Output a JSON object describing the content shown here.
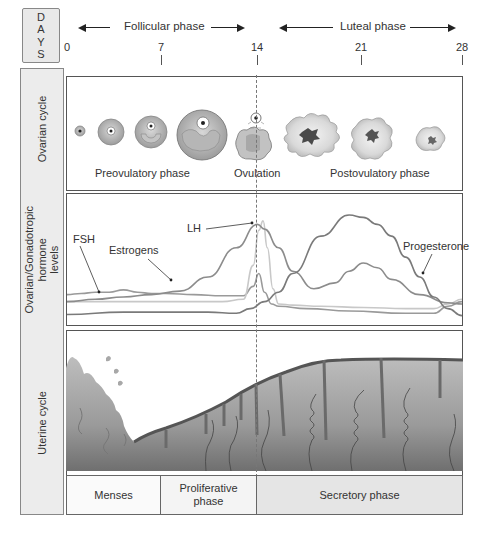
{
  "header": {
    "days_label": [
      "D",
      "A",
      "Y",
      "S"
    ],
    "follicular_phase": "Follicular phase",
    "luteal_phase": "Luteal phase",
    "day_ticks": [
      {
        "label": "0",
        "x": 67
      },
      {
        "label": "7",
        "x": 161
      },
      {
        "label": "14",
        "x": 257
      },
      {
        "label": "21",
        "x": 361
      },
      {
        "label": "28",
        "x": 463
      }
    ]
  },
  "rows": {
    "ovarian": {
      "label": "Ovarian cycle",
      "stage_labels": {
        "preovulatory": "Preovulatory phase",
        "ovulation": "Ovulation",
        "postovulatory": "Postovulatory phase"
      }
    },
    "hormone": {
      "label_lines": [
        "Ovarian/Gonadotropic",
        "hormone",
        "levels"
      ],
      "curve_labels": {
        "fsh": "FSH",
        "estrogens": "Estrogens",
        "lh": "LH",
        "progesterone": "Progesterone"
      }
    },
    "uterine": {
      "label": "Uterine cycle",
      "phases": [
        {
          "label": "Menses",
          "lines": [
            "Menses"
          ]
        },
        {
          "label": "Proliferative phase",
          "lines": [
            "Proliferative",
            "phase"
          ]
        },
        {
          "label": "Secretory phase",
          "lines": [
            "Secretory phase"
          ]
        }
      ]
    }
  },
  "chart_data": {
    "type": "line",
    "title": "Ovarian/Gonadotropic hormone levels",
    "xlabel": "Days",
    "ylabel": "Relative hormone level",
    "x_ticks": [
      0,
      7,
      14,
      21,
      28
    ],
    "xlim": [
      0,
      28
    ],
    "ylim": [
      0,
      100
    ],
    "grid": false,
    "series": [
      {
        "name": "FSH",
        "color": "#9a9a9a",
        "x": [
          0,
          1,
          2,
          3,
          4,
          5,
          6,
          7,
          9,
          11,
          12.5,
          13.2,
          13.6,
          14,
          14.5,
          15,
          17,
          20,
          24,
          26,
          27,
          28
        ],
        "y": [
          20,
          21,
          22,
          22,
          24,
          22,
          21,
          21,
          20,
          19,
          19,
          27,
          38,
          22,
          12,
          10,
          8,
          6,
          4,
          4,
          10,
          14
        ]
      },
      {
        "name": "LH",
        "color": "#c8c8c8",
        "x": [
          0,
          3,
          6,
          9,
          11,
          12.5,
          13.2,
          13.6,
          13.9,
          14.2,
          14.6,
          15,
          16,
          18,
          21,
          24,
          26,
          27,
          28
        ],
        "y": [
          14,
          14,
          14,
          14,
          14,
          16,
          45,
          75,
          83,
          60,
          25,
          12,
          11,
          10,
          9,
          8,
          8,
          12,
          16
        ]
      },
      {
        "name": "Estrogens",
        "color": "#8c8c8c",
        "x": [
          0,
          2,
          4,
          6,
          8,
          10,
          12,
          13.5,
          14,
          15,
          16,
          17.5,
          19,
          20,
          21,
          22,
          23,
          25,
          27,
          28
        ],
        "y": [
          14,
          16,
          18,
          20,
          23,
          35,
          60,
          80,
          76,
          60,
          40,
          25,
          30,
          40,
          47,
          43,
          33,
          20,
          13,
          12
        ]
      },
      {
        "name": "Progesterone",
        "color": "#7a7a7a",
        "x": [
          0,
          4,
          8,
          10,
          12,
          13,
          14,
          15,
          16,
          18,
          20,
          21,
          22,
          23,
          24,
          25,
          26,
          27,
          28
        ],
        "y": [
          3,
          5,
          5,
          5,
          4,
          8,
          14,
          22,
          38,
          70,
          88,
          86,
          80,
          70,
          52,
          35,
          18,
          8,
          2
        ]
      }
    ],
    "annotations": [
      {
        "text": "Ovulation",
        "x": 14
      },
      {
        "text": "Menses",
        "x_range": [
          0,
          7
        ]
      },
      {
        "text": "Proliferative phase",
        "x_range": [
          7,
          14
        ]
      },
      {
        "text": "Secretory phase",
        "x_range": [
          14,
          28
        ]
      }
    ]
  }
}
